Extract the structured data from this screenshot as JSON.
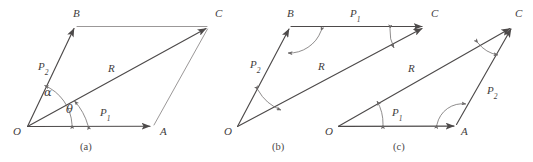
{
  "figure": {
    "background_color": "#ffffff",
    "line_color": "#4d4a4a",
    "thin_line_color": "#9b9898",
    "arc_color": "#6a6767",
    "text_color": "#3f3d3d"
  },
  "panels": [
    {
      "id": "a",
      "caption": "(a)",
      "caption_pos": {
        "x": 88,
        "y": 142
      },
      "vertices": [
        {
          "name": "O",
          "label": "O",
          "x": 27,
          "y": 127,
          "label_x": 13,
          "label_y": 130
        },
        {
          "name": "A",
          "label": "A",
          "x": 152,
          "y": 126,
          "label_x": 160,
          "label_y": 130
        },
        {
          "name": "B",
          "label": "B",
          "x": 75,
          "y": 27,
          "label_x": 73,
          "label_y": 10
        },
        {
          "name": "C",
          "label": "C",
          "x": 208,
          "y": 27,
          "label_x": 215,
          "label_y": 10
        }
      ],
      "vectors": [
        {
          "name": "P1",
          "base": "P",
          "sub": "1",
          "from": "O",
          "to": "A",
          "label_x": 100,
          "label_y": 110
        },
        {
          "name": "P2",
          "base": "P",
          "sub": "2",
          "from": "O",
          "to": "B",
          "label_x": 38,
          "label_y": 64
        },
        {
          "name": "R",
          "base": "R",
          "sub": "",
          "from": "O",
          "to": "C",
          "label_x": 108,
          "label_y": 66
        }
      ],
      "construction_lines": [
        {
          "from": "B",
          "to": "C"
        },
        {
          "from": "A",
          "to": "C"
        }
      ],
      "angles": [
        {
          "name": "alpha",
          "label": "α",
          "label_x": 44,
          "label_y": 90,
          "between": [
            "OA",
            "OB"
          ]
        },
        {
          "name": "theta",
          "label": "θ",
          "label_x": 66,
          "label_y": 107,
          "between": [
            "OA",
            "OC"
          ]
        }
      ]
    },
    {
      "id": "b",
      "caption": "(b)",
      "caption_pos": {
        "x": 280,
        "y": 142
      },
      "vertices": [
        {
          "name": "O",
          "label": "O",
          "x": 237,
          "y": 127,
          "label_x": 224,
          "label_y": 130
        },
        {
          "name": "B",
          "label": "B",
          "x": 290,
          "y": 27,
          "label_x": 287,
          "label_y": 10
        },
        {
          "name": "C",
          "label": "C",
          "x": 424,
          "y": 27,
          "label_x": 431,
          "label_y": 10
        }
      ],
      "vectors": [
        {
          "name": "P2",
          "base": "P",
          "sub": "2",
          "from": "O",
          "to": "B",
          "label_x": 250,
          "label_y": 62
        },
        {
          "name": "P1",
          "base": "P",
          "sub": "1",
          "from": "B",
          "to": "C",
          "label_x": 350,
          "label_y": 10
        },
        {
          "name": "R",
          "base": "R",
          "sub": "",
          "from": "O",
          "to": "C",
          "label_x": 318,
          "label_y": 64
        }
      ],
      "angles": [
        {
          "name": "angle-at-O",
          "between": [
            "OB",
            "OC"
          ]
        },
        {
          "name": "angle-at-B",
          "between": [
            "BO",
            "BC"
          ]
        },
        {
          "name": "angle-at-C",
          "between": [
            "CB",
            "CO"
          ]
        }
      ]
    },
    {
      "id": "c",
      "caption": "(c)",
      "caption_pos": {
        "x": 400,
        "y": 142
      },
      "vertices": [
        {
          "name": "O",
          "label": "O",
          "x": 338,
          "y": 127,
          "label_x": 325,
          "label_y": 130
        },
        {
          "name": "A",
          "label": "A",
          "x": 456,
          "y": 126,
          "label_x": 462,
          "label_y": 130
        },
        {
          "name": "C",
          "label": "C",
          "x": 512,
          "y": 27,
          "label_x": 515,
          "label_y": 10
        }
      ],
      "vectors": [
        {
          "name": "P1",
          "base": "P",
          "sub": "1",
          "from": "O",
          "to": "A",
          "label_x": 392,
          "label_y": 110
        },
        {
          "name": "P2",
          "base": "P",
          "sub": "2",
          "from": "A",
          "to": "C",
          "label_x": 487,
          "label_y": 88
        },
        {
          "name": "R",
          "base": "R",
          "sub": "",
          "from": "O",
          "to": "C",
          "label_x": 408,
          "label_y": 66
        }
      ],
      "angles": [
        {
          "name": "angle-at-O",
          "between": [
            "OA",
            "OC"
          ]
        },
        {
          "name": "angle-at-A",
          "between": [
            "AO",
            "AC"
          ]
        },
        {
          "name": "angle-at-C",
          "between": [
            "CA",
            "CO"
          ]
        }
      ]
    }
  ]
}
